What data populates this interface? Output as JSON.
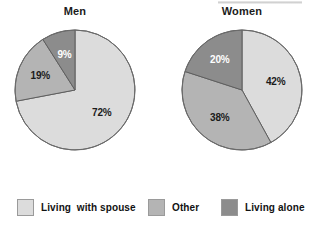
{
  "figure": {
    "name": "living-arrangement-pie-charts"
  },
  "charts": [
    {
      "id": "men",
      "title": "Men",
      "slices": [
        {
          "label": "Living with spouse",
          "value": 72,
          "display": "72%",
          "color": "#dcdcdc",
          "text_color": "dark"
        },
        {
          "label": "Other",
          "value": 19,
          "display": "19%",
          "color": "#b4b4b4",
          "text_color": "dark"
        },
        {
          "label": "Living alone",
          "value": 9,
          "display": "9%",
          "color": "#8c8c8c",
          "text_color": "light"
        }
      ]
    },
    {
      "id": "women",
      "title": "Women",
      "slices": [
        {
          "label": "Living with spouse",
          "value": 42,
          "display": "42%",
          "color": "#dcdcdc",
          "text_color": "dark"
        },
        {
          "label": "Other",
          "value": 38,
          "display": "38%",
          "color": "#b4b4b4",
          "text_color": "dark"
        },
        {
          "label": "Living alone",
          "value": 20,
          "display": "20%",
          "color": "#8c8c8c",
          "text_color": "light"
        }
      ]
    }
  ],
  "legend": {
    "items": [
      {
        "label": "Living  with spouse",
        "color": "#dcdcdc"
      },
      {
        "label": "Other",
        "color": "#b4b4b4"
      },
      {
        "label": "Living alone",
        "color": "#8c8c8c"
      }
    ]
  },
  "chart_data": {
    "type": "pie",
    "title": "",
    "subtitle": "",
    "legend_position": "bottom",
    "grid": false,
    "units": "percent",
    "categories": [
      "Living with spouse",
      "Other",
      "Living alone"
    ],
    "colors": [
      "#dcdcdc",
      "#b4b4b4",
      "#8c8c8c"
    ],
    "charts": [
      {
        "title": "Men",
        "labels": [
          "Living with spouse",
          "Other",
          "Living alone"
        ],
        "values": [
          72,
          19,
          9
        ],
        "value_labels": [
          "72%",
          "19%",
          "9%"
        ],
        "start_angle_deg": 0,
        "direction": "clockwise"
      },
      {
        "title": "Women",
        "labels": [
          "Living with spouse",
          "Other",
          "Living alone"
        ],
        "values": [
          42,
          38,
          20
        ],
        "value_labels": [
          "42%",
          "38%",
          "20%"
        ],
        "start_angle_deg": 0,
        "direction": "clockwise"
      }
    ]
  }
}
